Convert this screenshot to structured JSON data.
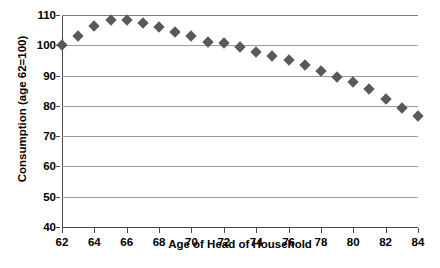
{
  "chart_data": {
    "type": "scatter",
    "title": "",
    "xlabel": "Age of Head of Household",
    "ylabel": "Consumption (age 62=100)",
    "xlim": [
      62,
      84
    ],
    "ylim": [
      40,
      110
    ],
    "xticks": [
      62,
      64,
      66,
      68,
      70,
      72,
      74,
      76,
      78,
      80,
      82,
      84
    ],
    "yticks": [
      40,
      50,
      60,
      70,
      80,
      90,
      100,
      110
    ],
    "grid": "horizontal",
    "legend": "none",
    "marker": "diamond",
    "marker_color": "#595959",
    "x": [
      62,
      63,
      64,
      65,
      66,
      67,
      68,
      69,
      70,
      71,
      72,
      73,
      74,
      75,
      76,
      77,
      78,
      79,
      80,
      81,
      82,
      83,
      84
    ],
    "values": [
      100.0,
      103.2,
      106.4,
      108.3,
      108.5,
      107.2,
      105.9,
      104.4,
      103.1,
      101.0,
      100.6,
      99.3,
      97.9,
      96.6,
      95.2,
      93.5,
      91.6,
      89.6,
      87.8,
      85.6,
      82.2,
      79.3,
      76.5
    ],
    "series": [
      {
        "name": "Consumption",
        "values": [
          100.0,
          103.2,
          106.4,
          108.3,
          108.5,
          107.2,
          105.9,
          104.4,
          103.1,
          101.0,
          100.6,
          99.3,
          97.9,
          96.6,
          95.2,
          93.5,
          91.6,
          89.6,
          87.8,
          85.6,
          82.2,
          79.3,
          76.5
        ]
      }
    ]
  }
}
